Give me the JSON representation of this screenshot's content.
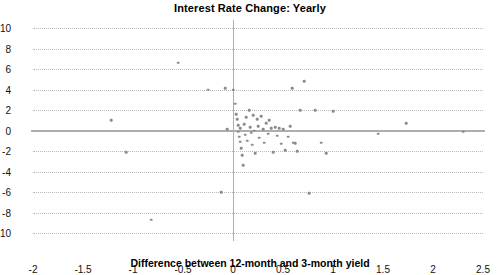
{
  "chart_data": {
    "type": "scatter",
    "title": "Interest Rate Change: Yearly",
    "xlabel": "Difference between 12-month and 3-month yield",
    "ylabel": "",
    "xlim": [
      -2,
      2.5
    ],
    "ylim": [
      -10,
      10
    ],
    "grid": true,
    "legend": null,
    "xticks": [
      -2,
      -1.5,
      -1,
      -0.5,
      0,
      0.5,
      1,
      1.5,
      2,
      2.5
    ],
    "xtick_labels": [
      "-2",
      "-1.5",
      "-1",
      "-0.5",
      "0",
      "0.5",
      "1",
      "1.5",
      "2",
      "2.5"
    ],
    "yticks": [
      10,
      8,
      6,
      4,
      2,
      0,
      -2,
      -4,
      -6,
      -8,
      -10
    ],
    "ytick_labels": [
      "10",
      "8",
      "6",
      "4",
      "2",
      "0",
      "-2",
      "-4",
      "-6",
      "-8",
      "-10"
    ],
    "reference_lines": [
      {
        "axis": "y",
        "value": 0,
        "style": "solid",
        "color": "#adadb2"
      },
      {
        "axis": "x",
        "value": 0,
        "style": "solid",
        "color": "#adadb2"
      }
    ],
    "marker": {
      "shape": "circle",
      "color": "#8a8a90",
      "size": 2.6
    },
    "points": [
      [
        -1.22,
        1.0
      ],
      [
        -1.07,
        -2.1
      ],
      [
        -0.82,
        -8.7
      ],
      [
        -0.55,
        6.6
      ],
      [
        -0.25,
        4.0
      ],
      [
        -0.12,
        -6.0
      ],
      [
        -0.08,
        4.1
      ],
      [
        -0.06,
        0.1
      ],
      [
        0.0,
        4.0
      ],
      [
        0.02,
        2.6
      ],
      [
        0.03,
        1.6
      ],
      [
        0.04,
        1.1
      ],
      [
        0.05,
        0.5
      ],
      [
        0.05,
        -0.1
      ],
      [
        0.06,
        -0.6
      ],
      [
        0.07,
        -1.1
      ],
      [
        0.07,
        0.2
      ],
      [
        0.08,
        -1.7
      ],
      [
        0.09,
        -2.4
      ],
      [
        0.1,
        -3.4
      ],
      [
        0.11,
        0.6
      ],
      [
        0.12,
        -0.4
      ],
      [
        0.13,
        1.3
      ],
      [
        0.14,
        -1.0
      ],
      [
        0.16,
        2.0
      ],
      [
        0.17,
        0.3
      ],
      [
        0.18,
        -0.2
      ],
      [
        0.19,
        -1.4
      ],
      [
        0.2,
        1.5
      ],
      [
        0.21,
        0.0
      ],
      [
        0.22,
        -2.2
      ],
      [
        0.24,
        1.1
      ],
      [
        0.25,
        0.4
      ],
      [
        0.26,
        -0.7
      ],
      [
        0.28,
        1.4
      ],
      [
        0.3,
        0.1
      ],
      [
        0.31,
        -1.2
      ],
      [
        0.33,
        0.7
      ],
      [
        0.35,
        -0.3
      ],
      [
        0.36,
        1.0
      ],
      [
        0.38,
        0.2
      ],
      [
        0.4,
        -2.1
      ],
      [
        0.42,
        0.3
      ],
      [
        0.44,
        -0.5
      ],
      [
        0.46,
        0.2
      ],
      [
        0.48,
        -1.3
      ],
      [
        0.5,
        0.1
      ],
      [
        0.52,
        -1.9
      ],
      [
        0.55,
        -0.6
      ],
      [
        0.57,
        0.4
      ],
      [
        0.59,
        4.1
      ],
      [
        0.6,
        -1.2
      ],
      [
        0.62,
        -1.25
      ],
      [
        0.64,
        -2.0
      ],
      [
        0.67,
        2.0
      ],
      [
        0.71,
        4.8
      ],
      [
        0.76,
        -6.1
      ],
      [
        0.82,
        2.0
      ],
      [
        0.88,
        -1.2
      ],
      [
        0.93,
        -2.2
      ],
      [
        1.0,
        1.9
      ],
      [
        1.45,
        -0.3
      ],
      [
        1.73,
        0.7
      ],
      [
        2.3,
        -0.1
      ]
    ]
  }
}
